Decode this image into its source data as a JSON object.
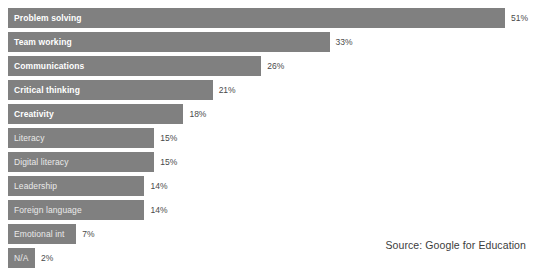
{
  "chart_data": {
    "type": "bar",
    "orientation": "horizontal",
    "title": "",
    "subtitle": "",
    "xlabel": "",
    "ylabel": "",
    "xlim": [
      0,
      51
    ],
    "grid": false,
    "legend": null,
    "value_suffix": "%",
    "categories": [
      "Problem solving",
      "Team working",
      "Communications",
      "Critical thinking",
      "Creativity",
      "Literacy",
      "Digital literacy",
      "Leadership",
      "Foreign language",
      "Emotional int",
      "N/A"
    ],
    "values": [
      51,
      33,
      26,
      21,
      18,
      15,
      15,
      14,
      14,
      7,
      2
    ],
    "value_labels": [
      "51%",
      "33%",
      "26%",
      "21%",
      "18%",
      "15%",
      "15%",
      "14%",
      "14%",
      "7%",
      "2%"
    ],
    "bar_color": "#808080",
    "background_color": "#ffffff",
    "value_label_color": "#4a4a4a",
    "bar_label_color": "#ffffff"
  },
  "source": {
    "text": "Source: Google for Education"
  }
}
